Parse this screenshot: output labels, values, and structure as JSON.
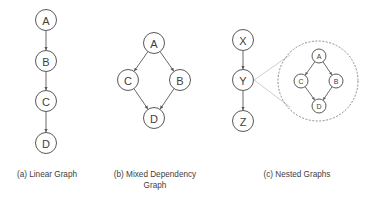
{
  "panels": [
    {
      "id": "a",
      "caption": [
        "(a) Linear Graph"
      ],
      "nodes": [
        "A",
        "B",
        "C",
        "D"
      ],
      "edges": [
        [
          "A",
          "B"
        ],
        [
          "B",
          "C"
        ],
        [
          "C",
          "D"
        ]
      ]
    },
    {
      "id": "b",
      "caption": [
        "(b) Mixed Dependency",
        "Graph"
      ],
      "nodes": [
        "A",
        "C",
        "B",
        "D"
      ],
      "edges": [
        [
          "A",
          "C"
        ],
        [
          "A",
          "B"
        ],
        [
          "C",
          "D"
        ],
        [
          "B",
          "D"
        ]
      ]
    },
    {
      "id": "c",
      "caption": [
        "(c) Nested Graphs"
      ],
      "nodes": [
        "X",
        "Y",
        "Z"
      ],
      "edges": [
        [
          "X",
          "Y"
        ],
        [
          "Y",
          "Z"
        ]
      ],
      "expanded_node": "Y",
      "nested": {
        "nodes": [
          "A",
          "C",
          "B",
          "D"
        ],
        "edges": [
          [
            "A",
            "C"
          ],
          [
            "A",
            "B"
          ],
          [
            "C",
            "D"
          ],
          [
            "B",
            "D"
          ]
        ]
      }
    }
  ]
}
